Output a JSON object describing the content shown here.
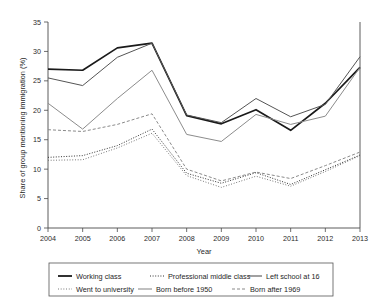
{
  "chart_data": {
    "type": "line",
    "title": "",
    "xlabel": "Year",
    "ylabel": "Share of group mentioning immigration (%)",
    "categories": [
      "2004",
      "2005",
      "2006",
      "2007",
      "2008",
      "2009",
      "2010",
      "2011",
      "2012",
      "2013"
    ],
    "x": [
      2004,
      2005,
      2006,
      2007,
      2008,
      2009,
      2010,
      2011,
      2012,
      2013
    ],
    "xlim": [
      2004,
      2013
    ],
    "ylim": [
      0,
      35
    ],
    "yticks": [
      0,
      5,
      10,
      15,
      20,
      25,
      30,
      35
    ],
    "ytick_labels": [
      "0",
      "5",
      "10",
      "15",
      "20",
      "25",
      "30",
      "35"
    ],
    "grid": false,
    "legend_position": "bottom",
    "series": [
      {
        "name": "Working class",
        "values": [
          27.0,
          26.8,
          30.6,
          31.4,
          19.1,
          17.7,
          20.1,
          16.6,
          21.2,
          27.3
        ],
        "color": "#1a1a1a",
        "width": 1.7,
        "dash": "none"
      },
      {
        "name": "Professional middle class",
        "values": [
          12.0,
          12.3,
          14.0,
          16.8,
          9.3,
          7.6,
          9.4,
          7.4,
          9.9,
          12.4
        ],
        "color": "#333333",
        "width": 1.0,
        "dash": "1,1.6"
      },
      {
        "name": "Left school at 16",
        "values": [
          25.5,
          24.2,
          29.0,
          31.4,
          19.2,
          17.9,
          22.0,
          18.9,
          21.0,
          29.1
        ],
        "color": "#555555",
        "width": 1.0,
        "dash": "none"
      },
      {
        "name": "Went to university",
        "values": [
          11.5,
          11.6,
          13.6,
          16.1,
          8.9,
          6.9,
          8.8,
          7.1,
          9.6,
          12.3
        ],
        "color": "#6a6a6a",
        "width": 1.0,
        "dash": "0.9,1.8"
      },
      {
        "name": "Born before 1950",
        "values": [
          21.2,
          16.8,
          22.0,
          26.8,
          15.9,
          14.7,
          19.3,
          17.6,
          19.0,
          27.3
        ],
        "color": "#8c8c8c",
        "width": 1.0,
        "dash": "none"
      },
      {
        "name": "Born after 1969",
        "values": [
          16.7,
          16.4,
          17.6,
          19.4,
          10.0,
          8.0,
          9.5,
          8.4,
          10.6,
          12.9
        ],
        "color": "#8a8a8a",
        "width": 1.0,
        "dash": "3,2"
      }
    ],
    "legend_entries": [
      {
        "label": "Working class",
        "dash": "none",
        "color": "#1a1a1a",
        "width": 1.8
      },
      {
        "label": "Professional middle class",
        "dash": "1,1.6",
        "color": "#333333",
        "width": 1.1
      },
      {
        "label": "Left school at 16",
        "dash": "none",
        "color": "#555555",
        "width": 1.1
      },
      {
        "label": "Went to university",
        "dash": "0.9,1.8",
        "color": "#6a6a6a",
        "width": 1.1
      },
      {
        "label": "Born before 1950",
        "dash": "none",
        "color": "#8c8c8c",
        "width": 1.1
      },
      {
        "label": "Born after 1969",
        "dash": "3,2",
        "color": "#8a8a8a",
        "width": 1.1
      }
    ]
  }
}
